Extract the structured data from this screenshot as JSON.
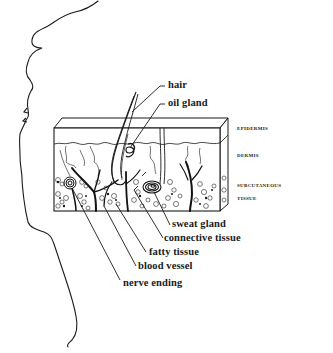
{
  "diagram": {
    "layers": [
      {
        "id": "epidermis",
        "label": "Epidermis"
      },
      {
        "id": "dermis",
        "label": "Dermis"
      },
      {
        "id": "subcutaneous",
        "label_line1": "Subcutaneous",
        "label_line2": "Tissue"
      }
    ],
    "structures": [
      {
        "id": "hair",
        "label": "hair"
      },
      {
        "id": "oil-gland",
        "label": "oil gland"
      },
      {
        "id": "sweat-gland",
        "label": "sweat gland"
      },
      {
        "id": "connective-tissue",
        "label": "connective tissue"
      },
      {
        "id": "fatty-tissue",
        "label": "fatty tissue"
      },
      {
        "id": "blood-vessel",
        "label": "blood vessel"
      },
      {
        "id": "nerve-ending",
        "label": "nerve ending"
      }
    ],
    "colors": {
      "ink": "#1a1a1a",
      "background": "#ffffff"
    }
  }
}
